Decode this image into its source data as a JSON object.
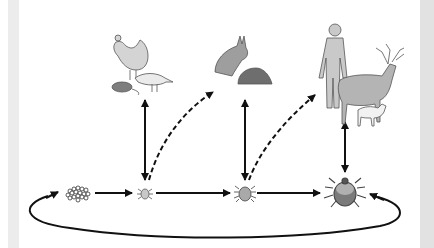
{
  "diagram": {
    "title": "",
    "stages": [
      {
        "id": "eggs",
        "label": "",
        "x": 79,
        "y": 193
      },
      {
        "id": "larva",
        "label": "",
        "x": 145,
        "y": 193
      },
      {
        "id": "nymph",
        "label": "",
        "x": 245,
        "y": 193
      },
      {
        "id": "adult",
        "label": "",
        "x": 345,
        "y": 193
      }
    ],
    "host_groups": [
      {
        "id": "larva-hosts",
        "animals": [
          "chicken",
          "mouse",
          "bird"
        ]
      },
      {
        "id": "nymph-hosts",
        "animals": [
          "rabbit",
          "hedgehog"
        ]
      },
      {
        "id": "adult-hosts",
        "animals": [
          "human",
          "deer",
          "dog"
        ]
      }
    ],
    "colors": {
      "line": "#111111",
      "tick_fill": "#9a9a9a",
      "animal_fill": "#bdbdbd",
      "strip_left": "#ececec",
      "strip_right": "#e2e2e2"
    }
  }
}
